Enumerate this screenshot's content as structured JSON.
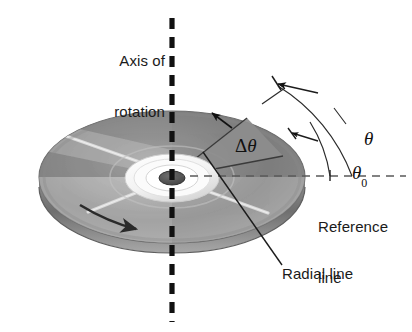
{
  "figure": {
    "background_color": "#ffffff"
  },
  "labels": {
    "axis_of_rotation_line1": "Axis of",
    "axis_of_rotation_line2": "rotation",
    "reference_line1": "Reference",
    "reference_line2": "line",
    "radial_line": "Radial line",
    "theta": "θ",
    "theta_zero_symbol": "θ",
    "theta_zero_subscript": "0",
    "delta_theta_delta": "Δ",
    "delta_theta_symbol": "θ"
  },
  "elements": {
    "axis_line_name": "axis-of-rotation-dashed-line",
    "reference_line_name": "reference-dashed-line",
    "disc_name": "compact-disc",
    "wedge_name": "delta-theta-wedge",
    "rotation_arrow_name": "rotation-direction-arrow",
    "theta_arc_name": "theta-arc",
    "theta_zero_arc_name": "theta-zero-arc",
    "radial_leader_name": "radial-line-leader"
  },
  "colors": {
    "ink": "#1a1a1a",
    "dash_black": "#111111",
    "disc_dark_gray": "#7d7d7d",
    "disc_mid_gray": "#949494",
    "disc_light_gray": "#b9b9b9",
    "disc_highlight": "#e8e8e8",
    "disc_edge": "#6a6a6a",
    "hub_white": "#f6f6f6",
    "hub_hole": "#4a4a4a",
    "wedge_gray": "#8a8a8a"
  },
  "geometry": {
    "center_x": 172,
    "center_y": 177,
    "disc_rx": 133,
    "disc_ry": 66,
    "axis_x": 172,
    "axis_top_y": 18,
    "axis_bottom_y": 322,
    "reference_line_y": 176,
    "reference_line_end_x": 406
  }
}
